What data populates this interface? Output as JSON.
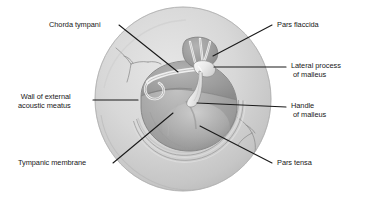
{
  "figure": {
    "background_color": "#ffffff",
    "leader_color": "#1a1a1a",
    "text_color": "#181818",
    "palette": {
      "outer_ring_light": "#dedede",
      "outer_ring_mid": "#c9c9c9",
      "outer_ring_dark": "#b3b3b3",
      "membrane_light": "#b9b9b9",
      "membrane_mid": "#a0a0a0",
      "membrane_dark": "#8a8a8a",
      "pars_flaccida": "#9a9a9a",
      "malleus_bone": "#f2f2f2",
      "vessel": "#8f8f8f",
      "outline": "#6e6e6e"
    }
  },
  "labels": {
    "chorda_tympani": "Chorda tympani",
    "wall_of_external_acoustic_meatus": {
      "line1": "Wall of external",
      "line2": "acoustic meatus"
    },
    "tympanic_membrane": "Tympanic membrane",
    "pars_flaccida": "Pars flaccida",
    "lateral_process_of_malleus": {
      "line1": "Lateral process",
      "line2": "of malleus"
    },
    "handle_of_malleus": {
      "line1": "Handle",
      "line2": "of malleus"
    },
    "pars_tensa": "Pars tensa"
  }
}
